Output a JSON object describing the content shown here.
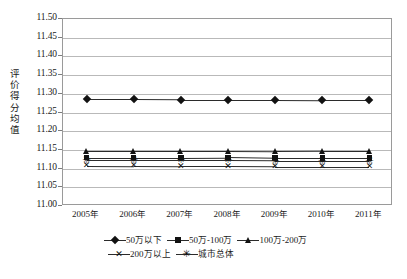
{
  "chart_data": {
    "type": "line",
    "title": "",
    "xlabel": "",
    "ylabel": "评价得分均值",
    "categories": [
      "2005年",
      "2006年",
      "2007年",
      "2008年",
      "2009年",
      "2010年",
      "2011年"
    ],
    "ylim": [
      11.0,
      11.5
    ],
    "ytick_step": 0.05,
    "yticks": [
      "11.50",
      "11.45",
      "11.40",
      "11.35",
      "11.30",
      "11.25",
      "11.20",
      "11.15",
      "11.10",
      "11.05",
      "11.00"
    ],
    "grid": "horizontal",
    "legend_position": "bottom",
    "series": [
      {
        "name": "50万以下",
        "marker": "diamond",
        "values": [
          11.285,
          11.285,
          11.284,
          11.284,
          11.284,
          11.283,
          11.283
        ]
      },
      {
        "name": "50万-100万",
        "marker": "square",
        "values": [
          11.129,
          11.129,
          11.129,
          11.13,
          11.128,
          11.128,
          11.128
        ]
      },
      {
        "name": "100万-200万",
        "marker": "triangle",
        "values": [
          11.148,
          11.148,
          11.148,
          11.148,
          11.147,
          11.148,
          11.148
        ]
      },
      {
        "name": "200万以上",
        "marker": "x",
        "values": [
          11.108,
          11.107,
          11.106,
          11.106,
          11.105,
          11.105,
          11.105
        ]
      },
      {
        "name": "城市总体",
        "marker": "asterisk",
        "values": [
          11.122,
          11.122,
          11.122,
          11.122,
          11.121,
          11.121,
          11.121
        ]
      }
    ],
    "colors": {
      "line": "#2b2b2b",
      "marker": "#121212",
      "grid": "#b9b9b9",
      "axis": "#9a9a9a"
    }
  },
  "legend": {
    "rows": [
      [
        {
          "label": "50万以下",
          "marker": "diamond"
        },
        {
          "label": "50万-100万",
          "marker": "square"
        },
        {
          "label": "100万-200万",
          "marker": "triangle"
        }
      ],
      [
        {
          "label": "200万以上",
          "marker": "x"
        },
        {
          "label": "城市总体",
          "marker": "asterisk"
        }
      ]
    ]
  },
  "axis": {
    "y_title": "评价得分均值"
  }
}
